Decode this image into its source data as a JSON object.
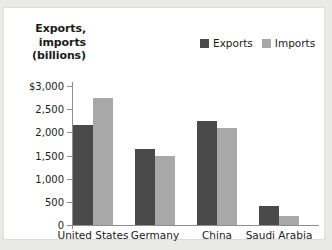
{
  "chart_data": {
    "type": "bar",
    "title": "",
    "ylabel": "Exports, imports (billions)",
    "ylabel_lines": [
      "Exports,",
      "imports",
      "(billions)"
    ],
    "xlabel": "",
    "categories": [
      "United States",
      "Germany",
      "China",
      "Saudi Arabia"
    ],
    "series": [
      {
        "name": "Exports",
        "color": "#4a4a4a",
        "values": [
          2150,
          1650,
          2250,
          400
        ]
      },
      {
        "name": "Imports",
        "color": "#a8a8a8",
        "values": [
          2750,
          1480,
          2100,
          200
        ]
      }
    ],
    "ylim": [
      0,
      3000
    ],
    "yticks": [
      0,
      500,
      1000,
      1500,
      2000,
      2500,
      3000
    ],
    "ytick_labels": [
      "0",
      "500",
      "1,000",
      "1,500",
      "2,000",
      "2,500",
      "$3,000"
    ],
    "grid": false,
    "legend_position": "top-right"
  },
  "colors": {
    "exports": "#4a4a4a",
    "imports": "#a8a8a8",
    "axis": "#8e8e8e",
    "panel_background": "#ffffff",
    "page_background": "#e9e9e7",
    "text": "#1b1b1b"
  }
}
